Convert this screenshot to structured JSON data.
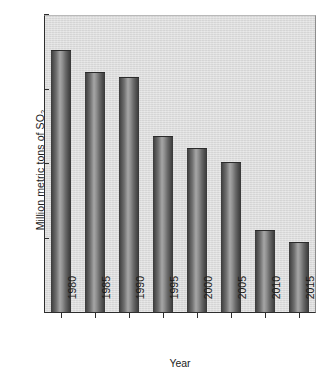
{
  "chart_data": {
    "type": "bar",
    "title": "",
    "subtitle": "",
    "xlabel": "Year",
    "ylabel": "Million metric tons of SO2",
    "ylabel_base": "Million metric tons of SO",
    "ylabel_subscript": "2",
    "categories": [
      "1980",
      "1985",
      "1990",
      "1995",
      "2000",
      "2005",
      "2010",
      "2015"
    ],
    "values": [
      17.6,
      16.1,
      15.8,
      11.8,
      11.0,
      10.1,
      5.5,
      4.7
    ],
    "ylim": [
      0,
      20
    ],
    "yticks": [
      0,
      5,
      10,
      15,
      20
    ],
    "ytick_labels": [
      "0",
      "5",
      "10",
      "15",
      "20"
    ],
    "grid": false,
    "legend": null,
    "legend_position": "none",
    "bar_color": "#6f6f6f",
    "panel_color": "#dadada",
    "axis_color": "#2e2e2e",
    "text_color": "#1c1c1c"
  }
}
